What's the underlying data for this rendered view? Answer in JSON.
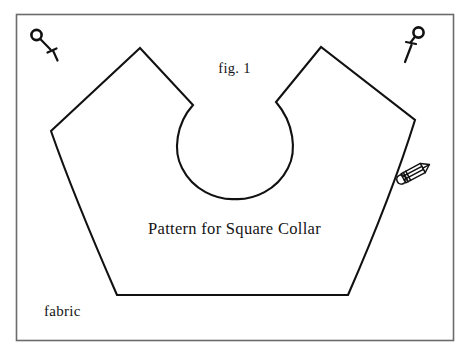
{
  "document": {
    "kind": "sewing-pattern-illustration",
    "background_color": "#ffffff",
    "ink_color": "#111111",
    "frame_color": "#6b6b6b",
    "width": 469,
    "height": 354
  },
  "labels": {
    "figure_number": "fig. 1",
    "caption": "Pattern for Square Collar",
    "material": "fabric"
  },
  "icons": {
    "pin_left": "pin-icon",
    "pin_right": "pin-icon",
    "pencil": "pencil-icon"
  },
  "shapes": {
    "frame": {
      "name": "fabric-frame",
      "x": 16,
      "y": 14,
      "width": 438,
      "height": 327
    },
    "collar": {
      "name": "collar-pattern-outline",
      "vertices": [
        {
          "label": "left-corner",
          "x": 51,
          "y": 131
        },
        {
          "label": "left-peak",
          "x": 140,
          "y": 48
        },
        {
          "label": "left-notch",
          "x": 193,
          "y": 105
        },
        {
          "label": "neck-bottom",
          "x": 235,
          "y": 188
        },
        {
          "label": "right-notch",
          "x": 276,
          "y": 102
        },
        {
          "label": "right-peak",
          "x": 321,
          "y": 47
        },
        {
          "label": "right-corner",
          "x": 415,
          "y": 120
        },
        {
          "label": "bottom-right",
          "x": 348,
          "y": 295
        },
        {
          "label": "bottom-left",
          "x": 117,
          "y": 295
        }
      ]
    }
  }
}
